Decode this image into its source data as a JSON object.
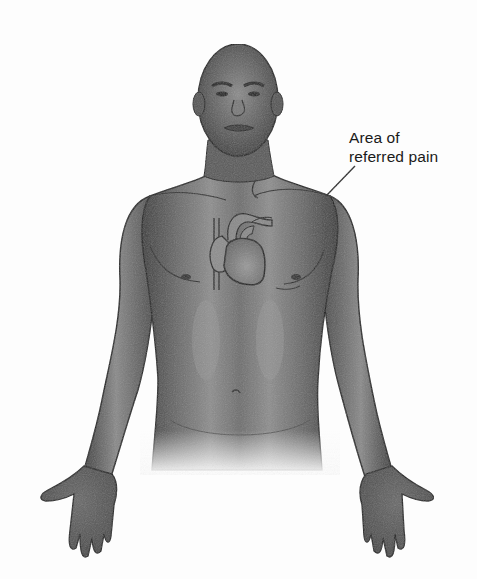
{
  "figure": {
    "style": "grayscale pencil-shaded medical illustration",
    "colors": {
      "background": "#fdfdfd",
      "skin_dark": "#4a4a4a",
      "skin_mid": "#7a7a7a",
      "skin_highlight": "#a8a8a8",
      "outline": "#1e1e1e",
      "label_text": "#1a1a1a"
    }
  },
  "callout": {
    "line1": "Area of",
    "line2": "referred pain",
    "target": "left shoulder"
  },
  "heart": {
    "position": "center-left chest"
  }
}
